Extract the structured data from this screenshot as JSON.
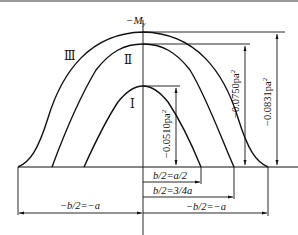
{
  "diagram": {
    "axis_label": "−M",
    "axis_label_sub": "y",
    "curves": [
      {
        "id": "I",
        "label": "Ⅰ",
        "peak": "−0.0510pa²",
        "half_width": "b/2=a/2"
      },
      {
        "id": "II",
        "label": "Ⅱ",
        "peak": "−0.0750pa²",
        "half_width": "b/2=3/4a"
      },
      {
        "id": "III",
        "label": "Ⅲ",
        "peak": "−0.0831pa²",
        "half_width": "−b/2=−a"
      }
    ],
    "dimensions": {
      "peak_I": "−0.0510pa",
      "peak_II": "−0.0750pa",
      "peak_III": "−0.0831pa",
      "sup": "2",
      "width_I": "b/2=a/2",
      "width_II": "b/2=3/4a",
      "width_III_right": "−b/2=−a",
      "width_III_left": "−b/2=−a"
    },
    "colors": {
      "line": "#111111",
      "background": "#ffffff"
    }
  }
}
